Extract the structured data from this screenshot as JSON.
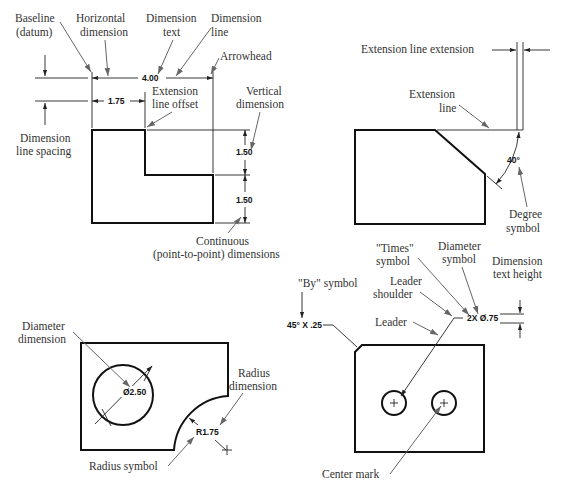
{
  "figure": {
    "panel_top_left": {
      "labels": {
        "baseline": [
          "Baseline",
          "(datum)"
        ],
        "horizontal_dimension": [
          "Horizontal",
          "dimension"
        ],
        "dimension_text": [
          "Dimension",
          "text"
        ],
        "dimension_line": [
          "Dimension",
          "line"
        ],
        "arrowhead": "Arrowhead",
        "extension_line_offset": [
          "Extension",
          "line offset"
        ],
        "vertical_dimension": [
          "Vertical",
          "dimension"
        ],
        "dimension_line_spacing": [
          "Dimension",
          "line spacing"
        ],
        "continuous": [
          "Continuous",
          "(point-to-point) dimensions"
        ]
      },
      "values": {
        "overall_width": "4.00",
        "partial_width": "1.75",
        "upper_height": "1.50",
        "lower_height": "1.50"
      }
    },
    "panel_top_right": {
      "labels": {
        "extension_line_extension": "Extension line extension",
        "extension_line": [
          "Extension",
          "line"
        ],
        "degree_symbol": [
          "Degree",
          "symbol"
        ]
      },
      "values": {
        "angle": "40°"
      }
    },
    "panel_bottom_left": {
      "labels": {
        "diameter_dimension": [
          "Diameter",
          "dimension"
        ],
        "radius_dimension": [
          "Radius",
          "dimension"
        ],
        "radius_symbol": "Radius symbol"
      },
      "values": {
        "diameter": "Ø2.50",
        "radius": "R1.75"
      }
    },
    "panel_bottom_right": {
      "labels": {
        "by_symbol": "\"By\" symbol",
        "times_symbol": [
          "\"Times\"",
          "symbol"
        ],
        "diameter_symbol": [
          "Diameter",
          "symbol"
        ],
        "dimension_text_height": [
          "Dimension",
          "text height"
        ],
        "leader_shoulder": [
          "Leader",
          "shoulder"
        ],
        "leader": "Leader",
        "center_mark": "Center mark"
      },
      "values": {
        "chamfer": "45° X .25",
        "hole_note": "2X Ø.75"
      }
    }
  }
}
